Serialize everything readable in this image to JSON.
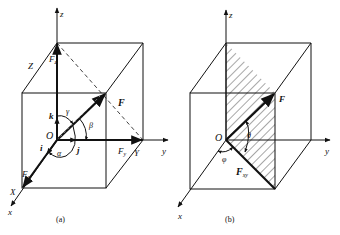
{
  "figures": [
    {
      "id": "a",
      "caption": "(a)",
      "axes": {
        "x": "x",
        "y": "y",
        "z": "z"
      },
      "origin": "O",
      "force": "F",
      "components": {
        "fx": "F",
        "fx_sub": "x",
        "fy": "F",
        "fy_sub": "y",
        "fz": "F",
        "fz_sub": "z"
      },
      "unit_vectors": {
        "i": "i",
        "j": "j",
        "k": "k"
      },
      "angles": {
        "alpha": "α",
        "beta": "β",
        "gamma": "γ"
      },
      "edge_labels": {
        "X": "X",
        "Y": "Y",
        "Z": "Z"
      }
    },
    {
      "id": "b",
      "caption": "(b)",
      "axes": {
        "x": "x",
        "y": "y",
        "z": "z"
      },
      "origin": "O",
      "force": "F",
      "projection": {
        "label": "F",
        "sub": "xy"
      },
      "angles": {
        "theta": "θ",
        "phi": "φ"
      }
    }
  ]
}
